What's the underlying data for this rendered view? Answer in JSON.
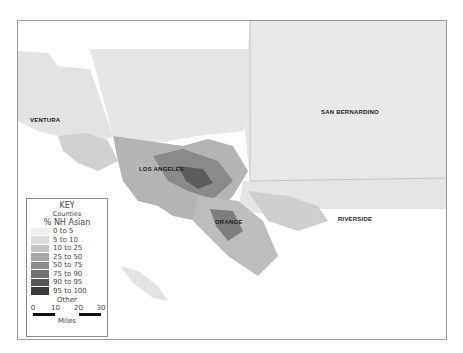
{
  "map": {
    "county_labels": [
      {
        "name": "VENTURA"
      },
      {
        "name": "LOS ANGELES"
      },
      {
        "name": "SAN BERNARDINO"
      },
      {
        "name": "ORANGE"
      },
      {
        "name": "RIVERSIDE"
      }
    ],
    "colors": {
      "land_base": "#e6e6e6",
      "ocean": "#ffffff",
      "frame": "#9a9a9a"
    }
  },
  "legend": {
    "title": "KEY",
    "counties_label": "Counties",
    "field_label": "% NH Asian",
    "classes": [
      {
        "label": "0 to 5",
        "color": "#efefef"
      },
      {
        "label": "5 to 10",
        "color": "#dcdcdc"
      },
      {
        "label": "10 to 25",
        "color": "#c4c4c4"
      },
      {
        "label": "25 to 50",
        "color": "#a8a8a8"
      },
      {
        "label": "50 to 75",
        "color": "#8c8c8c"
      },
      {
        "label": "75 to 90",
        "color": "#707070"
      },
      {
        "label": "90 to 95",
        "color": "#555555"
      },
      {
        "label": "95 to 100",
        "color": "#3a3a3a"
      }
    ],
    "other_label": "Other",
    "scale": {
      "ticks": [
        "0",
        "10",
        "20",
        "30"
      ],
      "unit": "Miles"
    }
  }
}
